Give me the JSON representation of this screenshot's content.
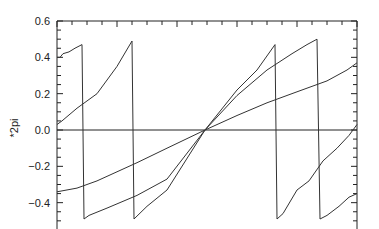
{
  "chart_data": {
    "type": "line",
    "title": "",
    "xlabel": "",
    "ylabel": "*2pi",
    "ylim": [
      -0.5,
      0.6
    ],
    "xlim": [
      0,
      300
    ],
    "grid": false,
    "legend": null,
    "yticks": [
      {
        "value": 0.6,
        "label": "0.6"
      },
      {
        "value": 0.4,
        "label": "0.4"
      },
      {
        "value": 0.2,
        "label": "0.2"
      },
      {
        "value": 0.0,
        "label": "0.0"
      },
      {
        "value": -0.2,
        "label": "-0.2"
      },
      {
        "value": -0.4,
        "label": "-0.4"
      }
    ],
    "reference_lines": [
      {
        "orientation": "horizontal",
        "value": 0.0
      }
    ],
    "series": [
      {
        "name": "phase-steep",
        "segments": [
          [
            [
              0,
              0.4
            ],
            [
              3,
              0.4
            ],
            [
              6,
              0.42
            ],
            [
              12,
              0.43
            ],
            [
              18,
              0.45
            ],
            [
              25,
              0.47
            ]
          ],
          [
            [
              27,
              -0.49
            ],
            [
              32,
              -0.47
            ],
            [
              50,
              -0.43
            ],
            [
              80,
              -0.36
            ],
            [
              110,
              -0.27
            ],
            [
              148,
              0.0
            ],
            [
              180,
              0.22
            ],
            [
              200,
              0.33
            ],
            [
              218,
              0.47
            ]
          ],
          [
            [
              220,
              -0.49
            ],
            [
              226,
              -0.46
            ],
            [
              240,
              -0.33
            ],
            [
              252,
              -0.28
            ],
            [
              266,
              -0.17
            ],
            [
              280,
              -0.1
            ],
            [
              292,
              -0.03
            ],
            [
              300,
              0.03
            ]
          ]
        ]
      },
      {
        "name": "phase-medium",
        "segments": [
          [
            [
              0,
              0.03
            ],
            [
              5,
              0.05
            ],
            [
              20,
              0.12
            ],
            [
              40,
              0.2
            ],
            [
              60,
              0.35
            ],
            [
              75,
              0.49
            ]
          ],
          [
            [
              77,
              -0.49
            ],
            [
              90,
              -0.42
            ],
            [
              110,
              -0.33
            ],
            [
              148,
              0.0
            ],
            [
              180,
              0.19
            ],
            [
              210,
              0.33
            ],
            [
              235,
              0.42
            ],
            [
              250,
              0.47
            ],
            [
              260,
              0.5
            ]
          ],
          [
            [
              263,
              -0.49
            ],
            [
              270,
              -0.47
            ],
            [
              282,
              -0.42
            ],
            [
              292,
              -0.37
            ],
            [
              300,
              -0.35
            ]
          ]
        ]
      },
      {
        "name": "phase-shallow",
        "segments": [
          [
            [
              0,
              -0.34
            ],
            [
              20,
              -0.32
            ],
            [
              40,
              -0.28
            ],
            [
              80,
              -0.18
            ],
            [
              110,
              -0.1
            ],
            [
              148,
              0.0
            ],
            [
              180,
              0.08
            ],
            [
              210,
              0.15
            ],
            [
              240,
              0.21
            ],
            [
              270,
              0.27
            ],
            [
              290,
              0.33
            ],
            [
              300,
              0.37
            ]
          ]
        ]
      }
    ]
  }
}
